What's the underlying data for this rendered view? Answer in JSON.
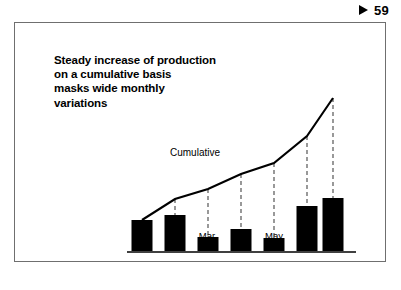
{
  "page_marker": {
    "triangle_icon": "play-triangle-icon",
    "page_number": "59"
  },
  "chart_title": {
    "line1": "Steady increase of production",
    "line2": "on a cumulative basis",
    "line3": "masks wide monthly",
    "line4": "variations"
  },
  "colors": {
    "bar_fill": "#000000",
    "line_stroke": "#000000",
    "leader_stroke": "#555555",
    "axis_stroke": "#000000",
    "frame_border": "#6f6f6f",
    "background": "#ffffff",
    "text": "#000000"
  },
  "chart_data": {
    "type": "bar",
    "title": "Steady increase of production on a cumulative basis masks wide monthly variations",
    "xlabel": "",
    "ylabel": "",
    "grid": false,
    "legend_position": "inline-annotation",
    "categories": [
      "Jan.",
      "Feb.",
      "Mar.",
      "Apr.",
      "May",
      "Jun.",
      "Jul."
    ],
    "series": [
      {
        "name": "Monthly production",
        "type": "bar",
        "values": [
          31,
          36,
          14,
          22,
          13,
          45,
          53
        ]
      },
      {
        "name": "Cumulative",
        "type": "line",
        "values": [
          31,
          67,
          81,
          103,
          116,
          161,
          214
        ]
      }
    ],
    "annotations": [
      {
        "text": "Cumulative",
        "target_series": "Cumulative"
      }
    ],
    "ylim": [
      0,
      230
    ],
    "bar_pixel_tops": [
      197,
      192,
      214,
      206,
      215,
      183,
      175
    ],
    "line_pixel_points": [
      {
        "x": 127,
        "y": 197
      },
      {
        "x": 160,
        "y": 176
      },
      {
        "x": 193,
        "y": 166
      },
      {
        "x": 226,
        "y": 151
      },
      {
        "x": 259,
        "y": 140
      },
      {
        "x": 292,
        "y": 113
      },
      {
        "x": 318,
        "y": 75
      }
    ],
    "leader_lines": [
      {
        "x": 160,
        "y_top": 176,
        "y_bottom": 192
      },
      {
        "x": 193,
        "y_top": 166,
        "y_bottom": 214
      },
      {
        "x": 226,
        "y_top": 151,
        "y_bottom": 206
      },
      {
        "x": 259,
        "y_top": 140,
        "y_bottom": 215
      },
      {
        "x": 292,
        "y_top": 113,
        "y_bottom": 183
      },
      {
        "x": 318,
        "y_top": 75,
        "y_bottom": 175
      }
    ],
    "baseline_y": 228,
    "axis_x_start": 112,
    "axis_x_end": 341,
    "bar_width": 21,
    "bar_centers": [
      127,
      160,
      193,
      226,
      259,
      292,
      318
    ]
  }
}
